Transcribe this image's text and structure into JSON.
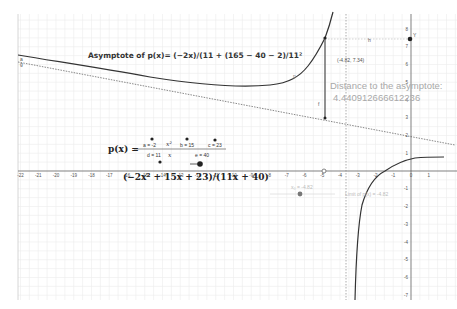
{
  "chart_data": {
    "type": "line",
    "title": "Asymptote of p(x)= (−2x)/(11 + (165 − 40 − 2)/11²",
    "function": "p(x) = (-2x^2 + 15x + 23)/(11x + 40)",
    "xlabel": "",
    "ylabel": "",
    "xlim": [
      -22,
      2
    ],
    "ylim": [
      -7,
      8
    ],
    "grid": true,
    "x_ticks": [
      -22,
      -21,
      -20,
      -19,
      -18,
      -17,
      -16,
      -15,
      -14,
      -13,
      -12,
      -11,
      -10,
      -9,
      -8,
      -7,
      -6,
      -5,
      -4,
      -3,
      -2,
      -1,
      0,
      1
    ],
    "y_ticks": [
      8,
      7,
      6,
      5,
      4,
      3,
      2,
      1,
      0,
      -1,
      -2,
      -3,
      -4,
      -5,
      -6,
      -7
    ],
    "series": [
      {
        "name": "p",
        "style": "solid",
        "branch": "left",
        "x": [
          -22,
          -20,
          -16,
          -12,
          -9,
          -7,
          -6,
          -5.5,
          -5,
          -4.82
        ],
        "y": [
          6.3,
          6.1,
          5.5,
          4.7,
          4.9,
          5.1,
          5.4,
          6.5,
          7.0,
          7.34
        ]
      },
      {
        "name": "p",
        "style": "solid",
        "branch": "right",
        "x": [
          -3.1,
          -3.0,
          -2.8,
          -2.3,
          -1.5,
          0,
          1.8
        ],
        "y": [
          -7,
          -4.1,
          -2,
          0,
          1,
          0.6,
          0.7
        ]
      },
      {
        "name": "g",
        "style": "dotted",
        "label": "oblique asymptote",
        "x": [
          -22,
          2
        ],
        "y": [
          6.1,
          1.7
        ]
      },
      {
        "name": "vertical asymptote",
        "style": "dotted",
        "x": [
          -3.64,
          -3.64
        ],
        "y": [
          -7,
          8
        ]
      }
    ],
    "points": [
      {
        "name": "T",
        "x": -4.82,
        "y": 7.34,
        "label": "(-4.82, 7.34)"
      },
      {
        "name": "Y",
        "x": 0,
        "y": 7.34
      },
      {
        "name": "asymptote point",
        "x": -4.82,
        "y": 2.9
      },
      {
        "name": "x-axis point",
        "x": -5,
        "y": 0
      }
    ],
    "annotations": [
      "Distance to the asymptote:",
      "4.440912666612236",
      "x₀ = -4.82",
      "Limit of p(x) = -4.82"
    ]
  },
  "labels": {
    "title": "Asymptote of p(x)= (−2x)/(11 + (165 − 40 − 2)/11²",
    "distance_line1": "Distance to the asymptote:",
    "distance_line2": "4.440912666612236",
    "point_coords": "(-4.82, 7.34)",
    "segment_h": "h",
    "segment_f": "f",
    "curve_p": "p",
    "point_y": "Y",
    "line_g_a": "a",
    "line_g_g": "g",
    "px_label": "p(x) =",
    "expression": "(−2x² + 15x + 23)/(11x + 40)",
    "slider_x0": "x₀ = -4.82",
    "limit_text": "Limit of p(x) = -4.82"
  },
  "formula": {
    "a": "a = -2",
    "x2": "x²",
    "b": "b = 15",
    "c": "c = 23",
    "d": "d = 11",
    "x": "x",
    "e": "e = 40"
  },
  "axes": {
    "x_tick_labels": [
      "-22",
      "-21",
      "-20",
      "-19",
      "-18",
      "-17",
      "-16",
      "-15",
      "-14",
      "-13",
      "-12",
      "-11",
      "-10",
      "-9",
      "-8",
      "-7",
      "-6",
      "-5",
      "-4",
      "-3",
      "-2",
      "-1",
      "0",
      "1"
    ],
    "y_tick_labels": [
      "8",
      "7",
      "6",
      "5",
      "4",
      "3",
      "2",
      "1",
      "-1",
      "-2",
      "-3",
      "-4",
      "-5",
      "-6",
      "-7"
    ]
  },
  "colors": {
    "curve": "#333333",
    "grid": "#eeeeee",
    "axis": "#444444",
    "point": "#222222",
    "faint_text": "#a8a8a8"
  }
}
